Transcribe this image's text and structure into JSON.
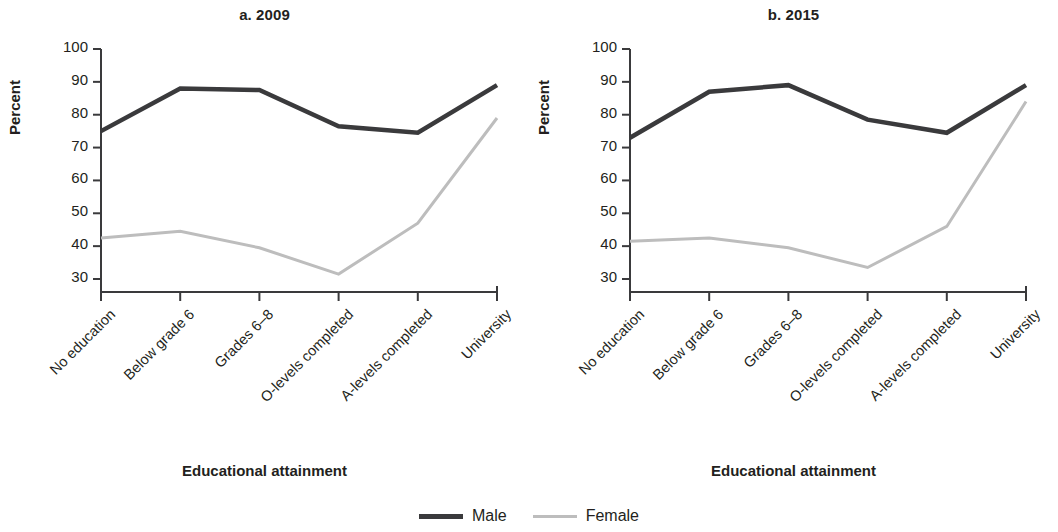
{
  "figure": {
    "legend": [
      {
        "name": "Male",
        "color": "#3a3a3c",
        "width": 5
      },
      {
        "name": "Female",
        "color": "#bdbdbd",
        "width": 3
      }
    ]
  },
  "chart_data": [
    {
      "type": "line",
      "title": "a. 2009",
      "xlabel": "Educational attainment",
      "ylabel": "Percent",
      "categories": [
        "No education",
        "Below grade 6",
        "Grades 6–8",
        "O-levels completed",
        "A-levels completed",
        "University"
      ],
      "yticks": [
        30,
        40,
        50,
        60,
        70,
        80,
        90,
        100
      ],
      "ylim": [
        26,
        100
      ],
      "grid": false,
      "legend_position": "bottom-center",
      "series": [
        {
          "name": "Male",
          "color": "#3a3a3c",
          "values": [
            75,
            88,
            87.5,
            76.5,
            74.5,
            89
          ]
        },
        {
          "name": "Female",
          "color": "#bdbdbd",
          "values": [
            42.5,
            44.5,
            39.5,
            31.5,
            47,
            79
          ]
        }
      ]
    },
    {
      "type": "line",
      "title": "b. 2015",
      "xlabel": "Educational attainment",
      "ylabel": "Percent",
      "categories": [
        "No education",
        "Below grade 6",
        "Grades 6–8",
        "O-levels completed",
        "A-levels completed",
        "University"
      ],
      "yticks": [
        30,
        40,
        50,
        60,
        70,
        80,
        90,
        100
      ],
      "ylim": [
        26,
        100
      ],
      "grid": false,
      "legend_position": "bottom-center",
      "series": [
        {
          "name": "Male",
          "color": "#3a3a3c",
          "values": [
            73,
            87,
            89,
            78.5,
            74.5,
            89
          ]
        },
        {
          "name": "Female",
          "color": "#bdbdbd",
          "values": [
            41.5,
            42.5,
            39.5,
            33.5,
            46,
            84
          ]
        }
      ]
    }
  ]
}
